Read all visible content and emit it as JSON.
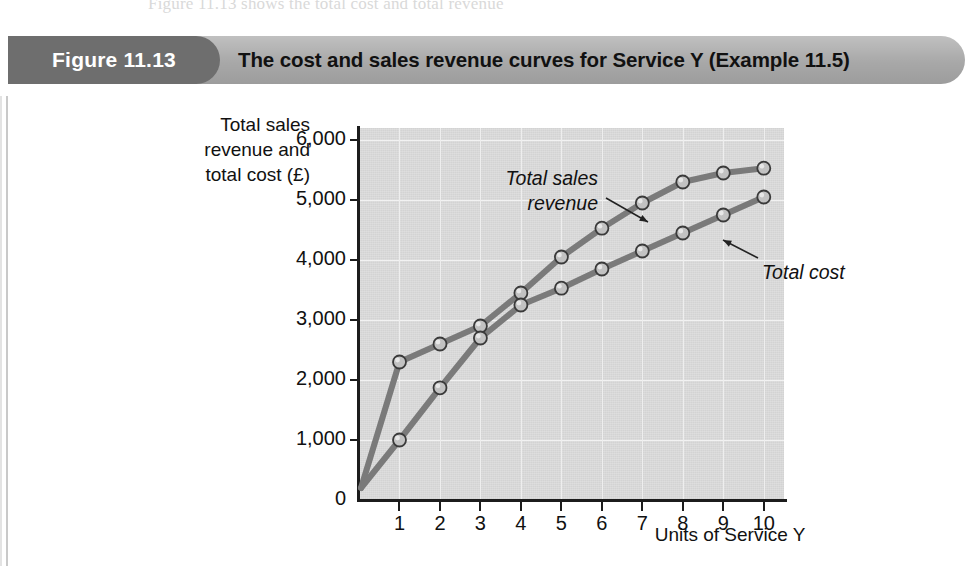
{
  "page": {
    "bleed_text": "Figure 11.13 shows the total cost and total revenue",
    "figure_tag": "Figure 11.13",
    "caption": "The cost and sales revenue curves for Service Y (Example 11.5)"
  },
  "colors": {
    "caption_bar": "#a8a8a8",
    "figure_tag": "#6e6e6e",
    "plot_background": "#d8d8d8",
    "gridline": "#f2f2f2",
    "axis": "#1c1c1c",
    "series_line": "#7a7a7a",
    "marker_fill": "#c2c2c2",
    "marker_stroke": "#3a3a3a"
  },
  "chart_data": {
    "type": "line",
    "title": "The cost and sales revenue curves for Service Y (Example 11.5)",
    "xlabel": "Units of Service Y",
    "ylabel": "Total sales revenue and total cost (£)",
    "ylabel_lines": [
      "Total sales",
      "revenue and",
      "total cost (£)"
    ],
    "x": [
      1,
      2,
      3,
      4,
      5,
      6,
      7,
      8,
      9,
      10
    ],
    "xticklabels": [
      "1",
      "2",
      "3",
      "4",
      "5",
      "6",
      "7",
      "8",
      "9",
      "10"
    ],
    "yticks": [
      0,
      1000,
      2000,
      3000,
      4000,
      5000,
      6000
    ],
    "yticklabels": [
      "0",
      "1,000",
      "2,000",
      "3,000",
      "4,000",
      "5,000",
      "6,000"
    ],
    "xlim": [
      0,
      10.5
    ],
    "ylim": [
      0,
      6200
    ],
    "grid": true,
    "legend": "annotations",
    "origin_point": {
      "x": 0.05,
      "y": 200
    },
    "series": [
      {
        "name": "Total sales revenue",
        "values": [
          2300,
          2600,
          2900,
          3450,
          4050,
          4530,
          4950,
          5300,
          5450,
          5530
        ]
      },
      {
        "name": "Total cost",
        "values": [
          1000,
          1870,
          2700,
          3250,
          3530,
          3850,
          4150,
          4450,
          4750,
          5050
        ]
      }
    ],
    "annotations": [
      {
        "text_lines": [
          "Total sales",
          "revenue"
        ],
        "target_series": "Total sales revenue"
      },
      {
        "text_lines": [
          "Total cost"
        ],
        "target_series": "Total cost"
      }
    ]
  }
}
